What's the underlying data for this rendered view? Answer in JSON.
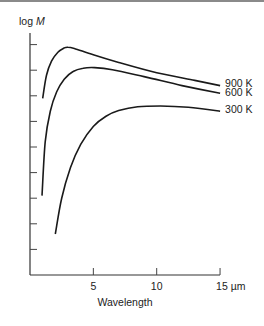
{
  "chart_data": {
    "type": "line",
    "title": "",
    "xlabel": "Wavelength",
    "ylabel": "log M",
    "xlim": [
      0,
      15
    ],
    "ylim": [
      0,
      9.5
    ],
    "x_ticks": [
      5,
      10,
      15
    ],
    "x_tick_labels": [
      "5",
      "10",
      "15 µm"
    ],
    "y_ticks": [
      1,
      2,
      3,
      4,
      5,
      6,
      7,
      8,
      9
    ],
    "y_tick_labels": [],
    "grid": false,
    "legend_position": "inline-right",
    "series": [
      {
        "name": "900 K",
        "x": [
          1.0,
          1.3,
          1.7,
          2.2,
          2.7,
          3.0,
          3.5,
          5,
          7,
          10,
          13,
          15
        ],
        "y": [
          6.9,
          7.8,
          8.35,
          8.7,
          8.87,
          8.9,
          8.85,
          8.6,
          8.3,
          7.9,
          7.6,
          7.4
        ]
      },
      {
        "name": "600 K",
        "x": [
          0.95,
          1.2,
          1.6,
          2.1,
          2.7,
          3.4,
          4.2,
          5.1,
          6.5,
          9,
          12,
          15
        ],
        "y": [
          3.1,
          5.2,
          6.4,
          7.15,
          7.65,
          7.95,
          8.08,
          8.1,
          8.02,
          7.75,
          7.4,
          7.1
        ]
      },
      {
        "name": "300 K",
        "x": [
          2.0,
          2.5,
          3.2,
          4.0,
          5.0,
          6.0,
          7.0,
          8.5,
          10.3,
          12.5,
          15
        ],
        "y": [
          1.6,
          3.0,
          4.2,
          5.1,
          5.8,
          6.2,
          6.42,
          6.57,
          6.6,
          6.55,
          6.4
        ]
      }
    ]
  }
}
